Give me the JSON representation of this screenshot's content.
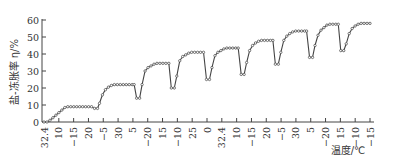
{
  "chart_data": {
    "type": "line",
    "title": "",
    "xlabel": "温度/℃",
    "ylabel": "盐-冻胀率 η/%",
    "ylim": [
      0,
      60
    ],
    "yticks": [
      0,
      10,
      20,
      30,
      40,
      50,
      60
    ],
    "grid": false,
    "legend": null,
    "x_tick_labels": [
      "32.4",
      "10",
      "−15",
      "20",
      "−5",
      "30",
      "5",
      "−20",
      "15",
      "−10",
      "25",
      "0",
      "32.4",
      "10",
      "−15",
      "20",
      "−5",
      "30",
      "5",
      "−20",
      "15",
      "−10",
      "−15"
    ],
    "x_tick_label_stagger": [
      "low",
      "high",
      "low",
      "high",
      "low",
      "high",
      "high",
      "low",
      "high",
      "low",
      "high",
      "high",
      "low",
      "high",
      "low",
      "high",
      "low",
      "high",
      "high",
      "low",
      "high",
      "low",
      "low"
    ],
    "series": [
      {
        "name": "盐-冻胀率",
        "color": "#444444",
        "marker": "circle-open",
        "points": [
          [
            0,
            0
          ],
          [
            0.3,
            0
          ],
          [
            0.6,
            1
          ],
          [
            0.9,
            2.5
          ],
          [
            1.2,
            4
          ],
          [
            1.5,
            5.5
          ],
          [
            1.8,
            7
          ],
          [
            2.1,
            8.5
          ],
          [
            2.4,
            9
          ],
          [
            2.7,
            9
          ],
          [
            3.0,
            9
          ],
          [
            3.3,
            9
          ],
          [
            3.6,
            9
          ],
          [
            3.9,
            9
          ],
          [
            4.2,
            9
          ],
          [
            4.5,
            9
          ],
          [
            4.8,
            9
          ],
          [
            5.1,
            8
          ],
          [
            5.4,
            8
          ],
          [
            5.6,
            11
          ],
          [
            5.9,
            16
          ],
          [
            6.2,
            19
          ],
          [
            6.5,
            20.5
          ],
          [
            6.8,
            21.5
          ],
          [
            7.1,
            22
          ],
          [
            7.4,
            22
          ],
          [
            7.7,
            22
          ],
          [
            8.0,
            22
          ],
          [
            8.3,
            22
          ],
          [
            8.6,
            22
          ],
          [
            8.9,
            22
          ],
          [
            9.1,
            22
          ],
          [
            9.35,
            14
          ],
          [
            9.65,
            14
          ],
          [
            9.9,
            22
          ],
          [
            10.2,
            30
          ],
          [
            10.5,
            32
          ],
          [
            10.8,
            33
          ],
          [
            11.1,
            34
          ],
          [
            11.4,
            34.5
          ],
          [
            11.7,
            34.5
          ],
          [
            12.0,
            34.5
          ],
          [
            12.3,
            34.5
          ],
          [
            12.6,
            34.5
          ],
          [
            12.85,
            20
          ],
          [
            13.15,
            20
          ],
          [
            13.4,
            27
          ],
          [
            13.7,
            36
          ],
          [
            14.0,
            38.5
          ],
          [
            14.3,
            39.5
          ],
          [
            14.6,
            40.5
          ],
          [
            14.9,
            41
          ],
          [
            15.2,
            41
          ],
          [
            15.5,
            41
          ],
          [
            15.8,
            41
          ],
          [
            16.1,
            41
          ],
          [
            16.4,
            25
          ],
          [
            16.7,
            25
          ],
          [
            16.95,
            32
          ],
          [
            17.25,
            39
          ],
          [
            17.55,
            41
          ],
          [
            17.85,
            42
          ],
          [
            18.15,
            43
          ],
          [
            18.45,
            43.5
          ],
          [
            18.75,
            43.5
          ],
          [
            19.05,
            43.5
          ],
          [
            19.35,
            43.5
          ],
          [
            19.6,
            43.5
          ],
          [
            19.9,
            28
          ],
          [
            20.2,
            28
          ],
          [
            20.45,
            35
          ],
          [
            20.75,
            42
          ],
          [
            21.05,
            45
          ],
          [
            21.35,
            46.5
          ],
          [
            21.65,
            47.5
          ],
          [
            21.95,
            48
          ],
          [
            22.25,
            48
          ],
          [
            22.55,
            48
          ],
          [
            22.85,
            48
          ],
          [
            23.1,
            48
          ]
        ]
      }
    ],
    "cycles": {
      "plateaus": [
        9,
        22,
        34.5,
        41,
        43.5,
        48,
        53.5,
        57.5,
        58
      ],
      "dips": [
        8,
        14,
        20,
        25,
        28,
        34,
        38,
        42
      ]
    }
  }
}
